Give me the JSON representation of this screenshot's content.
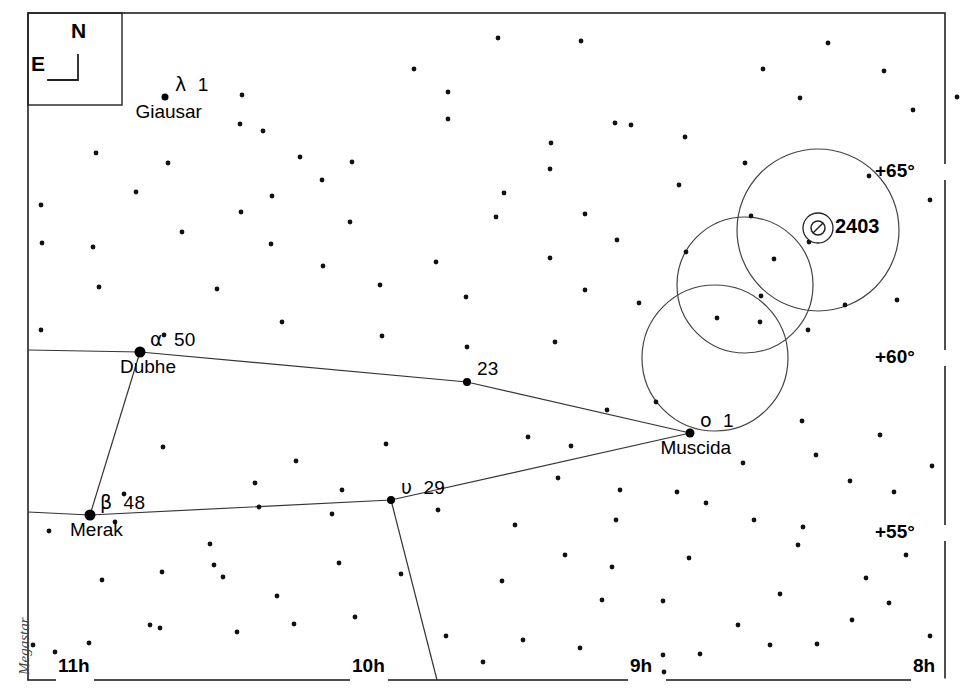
{
  "chart_data": {
    "type": "scatter",
    "xlabel": "Right Ascension",
    "ylabel": "Declination",
    "projection": "equatorial",
    "ra_axis": {
      "label": "Right Ascension",
      "unit": "hours",
      "direction": "increasing to the left",
      "ticks": [
        {
          "label": "11h",
          "x": 58
        },
        {
          "label": "10h",
          "x": 352
        },
        {
          "label": "9h",
          "x": 630
        },
        {
          "label": "8h",
          "x": 913
        }
      ]
    },
    "dec_axis": {
      "label": "Declination",
      "unit": "degrees",
      "ticks": [
        {
          "label": "+65°",
          "y": 172
        },
        {
          "label": "+60°",
          "y": 358
        },
        {
          "label": "+55°",
          "y": 533
        }
      ]
    },
    "named_stars": [
      {
        "designation_greek": "λ",
        "designation_number": "1",
        "proper_name": "Giausar",
        "x": 165,
        "y": 97,
        "mag_size": 7
      },
      {
        "designation_greek": "α",
        "designation_number": "50",
        "proper_name": "Dubhe",
        "x": 140,
        "y": 352,
        "mag_size": 11
      },
      {
        "designation_greek": "β",
        "designation_number": "48",
        "proper_name": "Merak",
        "x": 90,
        "y": 515,
        "mag_size": 11
      },
      {
        "designation_greek": "",
        "designation_number": "23",
        "proper_name": "",
        "x": 467,
        "y": 382,
        "mag_size": 8
      },
      {
        "designation_greek": "υ",
        "designation_number": "29",
        "proper_name": "",
        "x": 391,
        "y": 500,
        "mag_size": 8
      },
      {
        "designation_greek": "ο",
        "designation_number": "1",
        "proper_name": "Muscida",
        "x": 690,
        "y": 433,
        "mag_size": 9
      }
    ],
    "deep_sky_objects": [
      {
        "label": "2403",
        "type": "galaxy",
        "x": 818,
        "y": 228,
        "symbol": "galaxy-circle-slash"
      }
    ],
    "field_circles": [
      {
        "cx": 818,
        "cy": 230,
        "r": 81
      },
      {
        "cx": 745,
        "cy": 285,
        "r": 68
      },
      {
        "cx": 715,
        "cy": 358,
        "r": 73
      }
    ],
    "constellation_lines": [
      {
        "name": "merak-dubhe",
        "points": [
          [
            140,
            352
          ],
          [
            90,
            515
          ]
        ]
      },
      {
        "name": "dubhe-west",
        "points": [
          [
            140,
            352
          ],
          [
            28,
            350
          ]
        ]
      },
      {
        "name": "dubhe-23-muscida",
        "points": [
          [
            140,
            352
          ],
          [
            467,
            382
          ],
          [
            690,
            433
          ]
        ]
      },
      {
        "name": "merak-upsilon-muscida",
        "points": [
          [
            90,
            515
          ],
          [
            391,
            500
          ],
          [
            690,
            433
          ]
        ]
      },
      {
        "name": "merak-west",
        "points": [
          [
            90,
            515
          ],
          [
            28,
            512
          ]
        ]
      },
      {
        "name": "upsilon-south",
        "points": [
          [
            391,
            500
          ],
          [
            437,
            680
          ]
        ]
      }
    ],
    "background_stars": [
      [
        498,
        38
      ],
      [
        581,
        41
      ],
      [
        828,
        43
      ],
      [
        414,
        69
      ],
      [
        763,
        69
      ],
      [
        884,
        71
      ],
      [
        448,
        92
      ],
      [
        242,
        95
      ],
      [
        800,
        98
      ],
      [
        957,
        97
      ],
      [
        448,
        119
      ],
      [
        240,
        124
      ],
      [
        615,
        123
      ],
      [
        631,
        125
      ],
      [
        913,
        110
      ],
      [
        263,
        131
      ],
      [
        96,
        153
      ],
      [
        551,
        143
      ],
      [
        685,
        137
      ],
      [
        300,
        157
      ],
      [
        352,
        162
      ],
      [
        550,
        169
      ],
      [
        679,
        185
      ],
      [
        745,
        163
      ],
      [
        168,
        163
      ],
      [
        322,
        180
      ],
      [
        136,
        192
      ],
      [
        272,
        196
      ],
      [
        504,
        193
      ],
      [
        869,
        176
      ],
      [
        930,
        200
      ],
      [
        41,
        205
      ],
      [
        241,
        212
      ],
      [
        350,
        222
      ],
      [
        496,
        217
      ],
      [
        585,
        214
      ],
      [
        751,
        216
      ],
      [
        809,
        242
      ],
      [
        617,
        240
      ],
      [
        271,
        244
      ],
      [
        42,
        243
      ],
      [
        93,
        247
      ],
      [
        182,
        232
      ],
      [
        323,
        266
      ],
      [
        436,
        262
      ],
      [
        550,
        258
      ],
      [
        686,
        252
      ],
      [
        774,
        259
      ],
      [
        99,
        287
      ],
      [
        217,
        289
      ],
      [
        380,
        285
      ],
      [
        466,
        297
      ],
      [
        585,
        290
      ],
      [
        761,
        296
      ],
      [
        639,
        303
      ],
      [
        845,
        305
      ],
      [
        897,
        300
      ],
      [
        41,
        330
      ],
      [
        282,
        322
      ],
      [
        760,
        322
      ],
      [
        808,
        330
      ],
      [
        164,
        335
      ],
      [
        382,
        336
      ],
      [
        467,
        347
      ],
      [
        555,
        342
      ],
      [
        717,
        318
      ],
      [
        656,
        402
      ],
      [
        607,
        410
      ],
      [
        802,
        421
      ],
      [
        880,
        435
      ],
      [
        163,
        447
      ],
      [
        296,
        461
      ],
      [
        386,
        444
      ],
      [
        528,
        437
      ],
      [
        571,
        446
      ],
      [
        743,
        463
      ],
      [
        816,
        455
      ],
      [
        255,
        483
      ],
      [
        342,
        490
      ],
      [
        124,
        494
      ],
      [
        558,
        478
      ],
      [
        620,
        490
      ],
      [
        677,
        492
      ],
      [
        932,
        466
      ],
      [
        214,
        565
      ],
      [
        49,
        531
      ],
      [
        115,
        522
      ],
      [
        259,
        507
      ],
      [
        332,
        514
      ],
      [
        438,
        510
      ],
      [
        515,
        525
      ],
      [
        616,
        520
      ],
      [
        706,
        503
      ],
      [
        850,
        481
      ],
      [
        894,
        492
      ],
      [
        754,
        520
      ],
      [
        803,
        527
      ],
      [
        102,
        580
      ],
      [
        162,
        572
      ],
      [
        223,
        577
      ],
      [
        339,
        563
      ],
      [
        401,
        574
      ],
      [
        502,
        581
      ],
      [
        565,
        555
      ],
      [
        612,
        567
      ],
      [
        689,
        558
      ],
      [
        798,
        545
      ],
      [
        906,
        555
      ],
      [
        277,
        596
      ],
      [
        355,
        617
      ],
      [
        150,
        625
      ],
      [
        446,
        636
      ],
      [
        523,
        640
      ],
      [
        602,
        600
      ],
      [
        663,
        601
      ],
      [
        738,
        625
      ],
      [
        889,
        603
      ],
      [
        817,
        644
      ],
      [
        55,
        652
      ],
      [
        89,
        643
      ],
      [
        160,
        628
      ],
      [
        237,
        632
      ],
      [
        294,
        624
      ],
      [
        483,
        662
      ],
      [
        663,
        655
      ],
      [
        664,
        672
      ],
      [
        700,
        654
      ],
      [
        770,
        645
      ],
      [
        930,
        636
      ],
      [
        852,
        620
      ],
      [
        580,
        648
      ],
      [
        33,
        645
      ],
      [
        780,
        594
      ],
      [
        866,
        578
      ],
      [
        210,
        544
      ]
    ]
  },
  "compass": {
    "north_label": "N",
    "east_label": "E"
  },
  "credit": {
    "text": "Megastar"
  }
}
